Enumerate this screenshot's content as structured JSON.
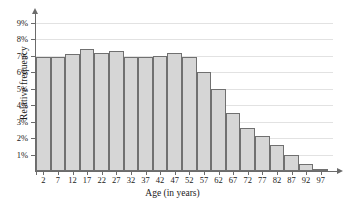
{
  "chart_data": {
    "type": "bar",
    "title": "",
    "subtitle": "",
    "xlabel": "Age (in years)",
    "ylabel": "Relative frequency",
    "categories": [
      "2",
      "7",
      "12",
      "17",
      "22",
      "27",
      "32",
      "37",
      "42",
      "47",
      "52",
      "57",
      "62",
      "67",
      "72",
      "77",
      "82",
      "87",
      "92",
      "97"
    ],
    "values": [
      6.9,
      6.9,
      7.1,
      7.4,
      7.2,
      7.3,
      6.9,
      6.9,
      7.0,
      7.2,
      6.9,
      6.0,
      5.0,
      3.5,
      2.6,
      2.1,
      1.6,
      1.0,
      0.4,
      0.1
    ],
    "y_tick_labels": [
      "9%",
      "8%",
      "7%",
      "6%",
      "5%",
      "4%",
      "3%",
      "2%",
      "1%"
    ],
    "y_tick_values": [
      9,
      8,
      7,
      6,
      5,
      4,
      3,
      2,
      1
    ],
    "ylim": [
      0,
      9.6
    ],
    "xlim_note": "categorical bins of width 5 years, centered on tick labels",
    "grid": "horizontal",
    "legend": "none",
    "bar_fill_color": "#d6d6d6",
    "bar_border_color": "#707070",
    "grid_color": "#e2e2e2",
    "axis_color": "#6b6b6b"
  }
}
